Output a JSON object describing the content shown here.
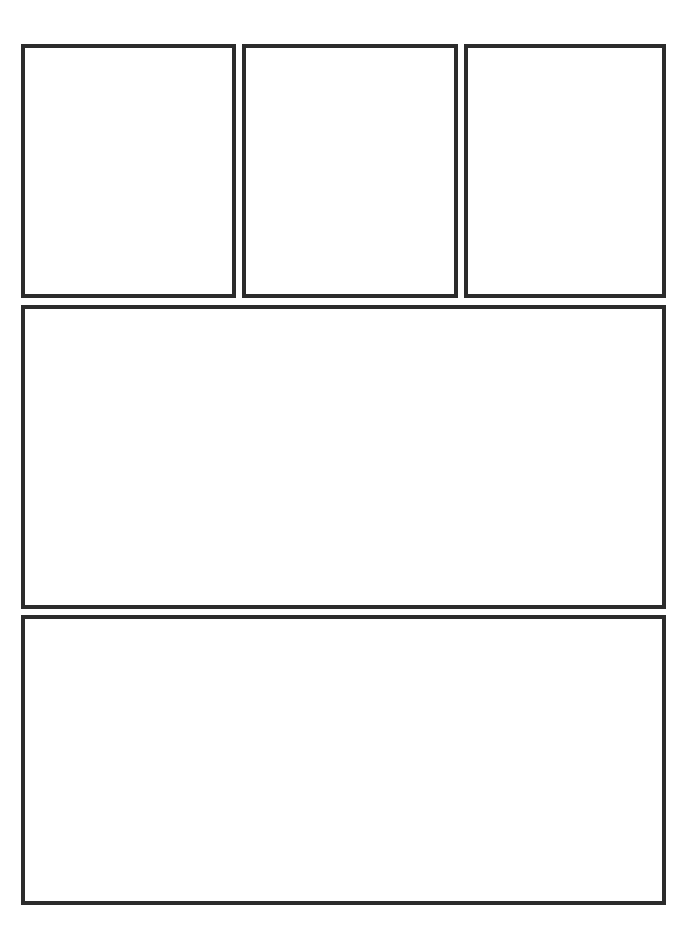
{
  "template": {
    "type": "comic-panel-layout",
    "border_color": "#2b2b2b",
    "background_color": "#ffffff",
    "panel_count": 5,
    "panels": [
      {
        "id": "panel-1",
        "row": 1,
        "content": ""
      },
      {
        "id": "panel-2",
        "row": 1,
        "content": ""
      },
      {
        "id": "panel-3",
        "row": 1,
        "content": ""
      },
      {
        "id": "panel-4",
        "row": 2,
        "content": ""
      },
      {
        "id": "panel-5",
        "row": 3,
        "content": ""
      }
    ]
  }
}
